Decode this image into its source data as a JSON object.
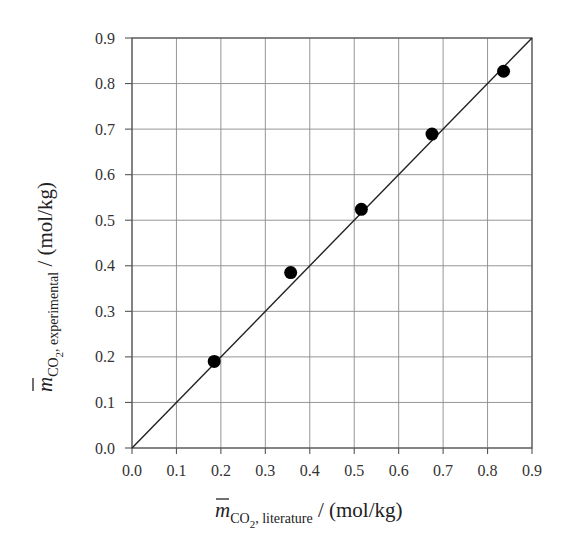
{
  "chart_data": {
    "type": "scatter",
    "title": "",
    "xlabel": "m̄ CO2, literature / (mol/kg)",
    "ylabel": "m̄ CO2, experimental / (mol/kg)",
    "xlim": [
      0.0,
      0.9
    ],
    "ylim": [
      0.0,
      0.9
    ],
    "grid": true,
    "legend": null,
    "x_ticks": [
      "0.0",
      "0.1",
      "0.2",
      "0.3",
      "0.4",
      "0.5",
      "0.6",
      "0.7",
      "0.8",
      "0.9"
    ],
    "y_ticks": [
      "0.0",
      "0.1",
      "0.2",
      "0.3",
      "0.4",
      "0.5",
      "0.6",
      "0.7",
      "0.8",
      "0.9"
    ],
    "series": [
      {
        "name": "data",
        "kind": "scatter",
        "marker": "filled-circle",
        "color": "#000000",
        "x": [
          0.185,
          0.357,
          0.516,
          0.675,
          0.836
        ],
        "y": [
          0.19,
          0.385,
          0.524,
          0.689,
          0.827
        ]
      },
      {
        "name": "y = x",
        "kind": "line",
        "color": "#222222",
        "x": [
          0.0,
          0.9
        ],
        "y": [
          0.0,
          0.9
        ]
      }
    ]
  },
  "labels": {
    "x_axis": {
      "symbol": "m",
      "subscript_main": "CO",
      "subscript_num": "2",
      "subscript_rest": ", literature",
      "unit": " / (mol/kg)"
    },
    "y_axis": {
      "symbol": "m",
      "subscript_main": "CO",
      "subscript_num": "2",
      "subscript_rest": ", experimental",
      "unit": " / (mol/kg)"
    }
  }
}
